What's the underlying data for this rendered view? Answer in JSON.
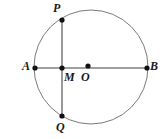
{
  "figure": {
    "type": "geometry-diagram",
    "canvas": {
      "width": 167,
      "height": 139,
      "background": "#ffffff"
    },
    "colors": {
      "stroke": "#808080",
      "circle_stroke": "#7a7a7a",
      "point_fill": "#111111",
      "label_color": "#1a1a1a"
    },
    "circle": {
      "cx": 91,
      "cy": 67,
      "r": 57,
      "stroke_width": 1
    },
    "segments": [
      {
        "name": "diameter-ab",
        "x1": 35,
        "y1": 68,
        "x2": 147,
        "y2": 68,
        "stroke_width": 1.6
      },
      {
        "name": "chord-pq",
        "x1": 62,
        "y1": 20,
        "x2": 62,
        "y2": 116,
        "stroke_width": 1.6
      }
    ],
    "points": [
      {
        "id": "P",
        "label": "P",
        "x": 62,
        "y": 20,
        "r": 2.6,
        "label_x": 53,
        "label_y": 2
      },
      {
        "id": "A",
        "label": "A",
        "x": 35,
        "y": 68,
        "r": 2.6,
        "label_x": 22,
        "label_y": 60
      },
      {
        "id": "M",
        "label": "M",
        "x": 62,
        "y": 68,
        "r": 2.6,
        "label_x": 64,
        "label_y": 71
      },
      {
        "id": "O",
        "label": "O",
        "x": 88,
        "y": 66,
        "r": 2.6,
        "label_x": 81,
        "label_y": 71
      },
      {
        "id": "B",
        "label": "B",
        "x": 147,
        "y": 68,
        "r": 2.6,
        "label_x": 150,
        "label_y": 60
      },
      {
        "id": "Q",
        "label": "Q",
        "x": 62,
        "y": 116,
        "r": 2.6,
        "label_x": 56,
        "label_y": 121
      }
    ]
  }
}
